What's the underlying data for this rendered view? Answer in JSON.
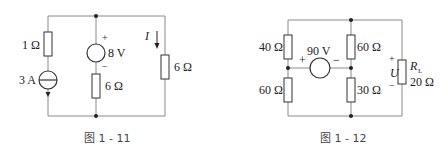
{
  "figures": [
    {
      "caption": "图 1 - 11",
      "labels": {
        "r_left": "1 Ω",
        "current_source": "3 A",
        "voltage_source": "8 V",
        "vs_plus": "+",
        "vs_minus": "−",
        "r_mid": "6 Ω",
        "current_label": "I",
        "r_right": "6 Ω"
      }
    },
    {
      "caption": "图 1 - 12",
      "labels": {
        "r_top_left": "40 Ω",
        "r_bottom_left": "60 Ω",
        "voltage_source": "90 V",
        "vs_plus": "+",
        "vs_minus": "−",
        "r_top_mid": "60 Ω",
        "r_bottom_mid": "30 Ω",
        "u_plus": "+",
        "u_label": "U",
        "u_minus": "−",
        "rl_label": "R",
        "rl_sub": "L",
        "rl_value": "20 Ω"
      }
    }
  ]
}
